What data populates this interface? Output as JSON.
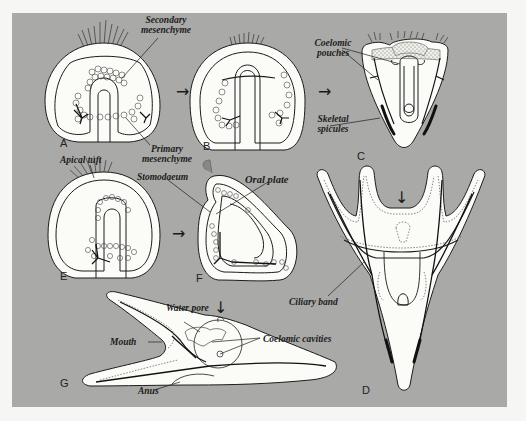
{
  "figure": {
    "panels": [
      {
        "id": "A",
        "letter": "A"
      },
      {
        "id": "B",
        "letter": "B"
      },
      {
        "id": "C",
        "letter": "C"
      },
      {
        "id": "D",
        "letter": "D"
      },
      {
        "id": "E",
        "letter": "E"
      },
      {
        "id": "F",
        "letter": "F"
      },
      {
        "id": "G",
        "letter": "G"
      }
    ],
    "labels": {
      "secondary_mesenchyme_1": "Secondary",
      "secondary_mesenchyme_2": "mesenchyme",
      "primary_mesenchyme_1": "Primary",
      "primary_mesenchyme_2": "mesenchyme",
      "coelomic_pouches_1": "Coelomic",
      "coelomic_pouches_2": "pouches",
      "skeletal_spicules_1": "Skeletal",
      "skeletal_spicules_2": "spicules",
      "apical_tuft": "Apical tuft",
      "stomodaeum": "Stomodaeum",
      "oral_plate": "Oral plate",
      "ciliary_band": "Ciliary band",
      "water_pore": "Water pore",
      "coelomic_cavities": "Coelomic cavities",
      "mouth": "Mouth",
      "anus": "Anus"
    },
    "arrows": {
      "right": "→",
      "down": "↓"
    },
    "colors": {
      "background": "#f6f6f4",
      "panel": "#a9a9a7",
      "body_fill": "#fbfbf8",
      "ink": "#1c1c1c"
    }
  }
}
